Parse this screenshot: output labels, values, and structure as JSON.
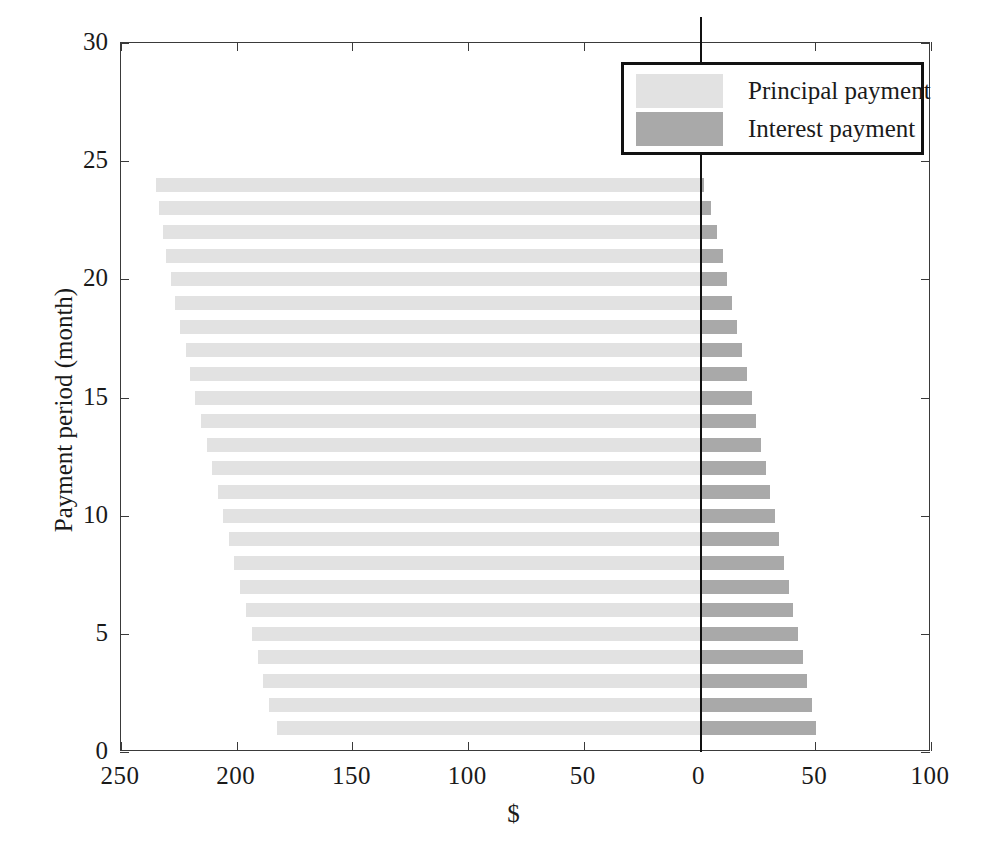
{
  "chart_data": {
    "type": "bar",
    "orientation": "horizontal",
    "title": "",
    "xlabel": "$",
    "ylabel": "Payment period (month)",
    "xtick_labels": [
      "250",
      "200",
      "150",
      "100",
      "50",
      "0",
      "50",
      "100"
    ],
    "xtick_values": [
      -250,
      -200,
      -150,
      -100,
      -50,
      0,
      50,
      100
    ],
    "xlim": [
      -250,
      100
    ],
    "ylim": [
      0,
      30
    ],
    "ytick_labels": [
      "0",
      "5",
      "10",
      "15",
      "20",
      "25",
      "30"
    ],
    "ytick_values": [
      0,
      5,
      10,
      15,
      20,
      25,
      30
    ],
    "grid": false,
    "legend_position": "top-right",
    "note": "Diverging horizontal bars: principal extends left of the zero line (plotted as negative), interest extends right (positive). X axis is mirrored so both sides read as positive dollars.",
    "categories": [
      1,
      2,
      3,
      4,
      5,
      6,
      7,
      8,
      9,
      10,
      11,
      12,
      13,
      14,
      15,
      16,
      17,
      18,
      19,
      20,
      21,
      22,
      23,
      24
    ],
    "series": [
      {
        "name": "Principal payment",
        "color": "#e2e2e2",
        "direction": "left",
        "values": [
          182.5,
          186.0,
          188.5,
          191.0,
          193.5,
          196.0,
          198.5,
          201.0,
          203.5,
          206.0,
          208.0,
          210.5,
          213.0,
          215.5,
          218.0,
          220.0,
          222.0,
          224.5,
          226.5,
          228.5,
          230.5,
          232.0,
          233.5,
          235.0
        ]
      },
      {
        "name": "Interest payment",
        "color": "#a9a9a9",
        "direction": "right",
        "values": [
          50.5,
          48.5,
          46.5,
          44.5,
          42.5,
          40.5,
          38.5,
          36.5,
          34.5,
          32.5,
          30.5,
          28.5,
          26.5,
          24.5,
          22.5,
          20.5,
          18.5,
          16.0,
          14.0,
          12.0,
          10.0,
          7.5,
          5.0,
          2.0
        ]
      }
    ]
  },
  "legend": {
    "entries": [
      {
        "label": "Principal payment",
        "swatch": "principal"
      },
      {
        "label": "Interest payment",
        "swatch": "interest"
      }
    ]
  },
  "axes": {
    "x_title": "$",
    "y_title": "Payment period (month)"
  }
}
